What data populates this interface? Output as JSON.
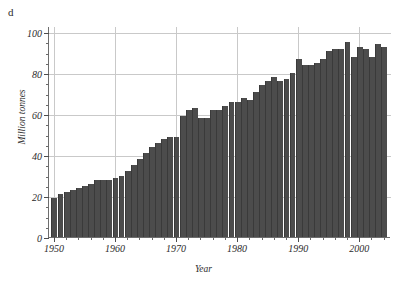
{
  "panel": {
    "letter": "d"
  },
  "axes": {
    "xlabel": "Year",
    "ylabel": "Million tonnes",
    "y_ticks": [
      0,
      20,
      40,
      60,
      80,
      100
    ],
    "x_ticks": [
      1950,
      1960,
      1970,
      1980,
      1990,
      2000
    ]
  },
  "style": {
    "bar_color": "#4c4c4c",
    "grid_color": "#c9c9c9",
    "axis_color": "#6d6d6d",
    "text_color": "#2b2b2b",
    "background": "#ffffff"
  },
  "chart_data": {
    "type": "bar",
    "title": "",
    "subtitle": "",
    "panel_label": "d",
    "xlabel": "Year",
    "ylabel": "Million tonnes",
    "xlim": [
      1949.2,
      2005.2
    ],
    "ylim": [
      0,
      103
    ],
    "grid": true,
    "legend": null,
    "y_tick_step": 20,
    "y_minor_step": 5,
    "x_tick_step": 10,
    "x_minor_step": 2,
    "categories": [
      1950,
      1951,
      1952,
      1953,
      1954,
      1955,
      1956,
      1957,
      1958,
      1959,
      1960,
      1961,
      1962,
      1963,
      1964,
      1965,
      1966,
      1967,
      1968,
      1969,
      1970,
      1971,
      1972,
      1973,
      1974,
      1975,
      1976,
      1977,
      1978,
      1979,
      1980,
      1981,
      1982,
      1983,
      1984,
      1985,
      1986,
      1987,
      1988,
      1989,
      1990,
      1991,
      1992,
      1993,
      1994,
      1995,
      1996,
      1997,
      1998,
      1999,
      2000,
      2001,
      2002,
      2003,
      2004
    ],
    "values": [
      19,
      21,
      22,
      23,
      24,
      25,
      26,
      28,
      28,
      28,
      29,
      30,
      32,
      35,
      38,
      41,
      44,
      46,
      48,
      49,
      49,
      59,
      62,
      63,
      58,
      58,
      62,
      62,
      64,
      66,
      66,
      68,
      67,
      71,
      74,
      76,
      78,
      76,
      77,
      80,
      87,
      84,
      84,
      85,
      87,
      91,
      92,
      92,
      95,
      88,
      93,
      92,
      88,
      94,
      93
    ],
    "series": [
      {
        "name": "Million tonnes",
        "values": [
          19,
          21,
          22,
          23,
          24,
          25,
          26,
          28,
          28,
          28,
          29,
          30,
          32,
          35,
          38,
          41,
          44,
          46,
          48,
          49,
          49,
          59,
          62,
          63,
          58,
          58,
          62,
          62,
          64,
          66,
          66,
          68,
          67,
          71,
          74,
          76,
          78,
          76,
          77,
          80,
          87,
          84,
          84,
          85,
          87,
          91,
          92,
          92,
          95,
          88,
          93,
          92,
          88,
          94,
          93
        ]
      }
    ]
  }
}
